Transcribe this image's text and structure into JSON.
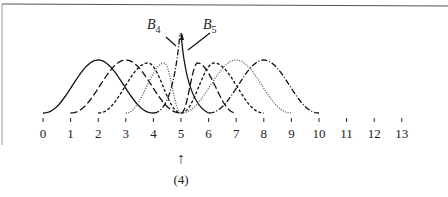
{
  "figure": {
    "title": "",
    "axis": {
      "ticks": [
        "0",
        "1",
        "2",
        "3",
        "4",
        "5",
        "6",
        "7",
        "8",
        "9",
        "10",
        "11",
        "12",
        "13"
      ],
      "x0_px": 43,
      "spacing_px": 27.6,
      "baseline_px": 113
    },
    "annotations": {
      "b4_label": "B",
      "b4_sub": "4",
      "b5_label": "B",
      "b5_sub": "5",
      "arrow": "↑",
      "multiplicity_label": "(4)"
    }
  },
  "chart_data": {
    "type": "line",
    "xlabel": "",
    "ylabel": "",
    "x_ticks": [
      0,
      1,
      2,
      3,
      4,
      5,
      6,
      7,
      8,
      9,
      10,
      11,
      12,
      13
    ],
    "series": [
      {
        "name": "B0",
        "style": "solid",
        "support": [
          0,
          4
        ],
        "peak_x": 2
      },
      {
        "name": "B1",
        "style": "long-dash",
        "support": [
          1,
          5
        ],
        "peak_x": 3
      },
      {
        "name": "B2",
        "style": "dashed",
        "support": [
          2,
          5
        ],
        "peak_x": 3.8
      },
      {
        "name": "B3",
        "style": "dotted",
        "support": [
          3,
          5
        ],
        "peak_x": 4.4
      },
      {
        "name": "B4",
        "style": "dash-dot",
        "support": [
          4,
          5
        ],
        "peak_x": 5,
        "note": "spike at knot 5"
      },
      {
        "name": "B5",
        "style": "solid",
        "support": [
          5,
          6
        ],
        "peak_x": 5,
        "note": "spike at knot 5"
      },
      {
        "name": "B6",
        "style": "long-dash",
        "support": [
          5,
          7
        ],
        "peak_x": 5.6
      },
      {
        "name": "B7",
        "style": "dashed",
        "support": [
          5,
          8
        ],
        "peak_x": 6.2
      },
      {
        "name": "B8",
        "style": "dotted",
        "support": [
          5,
          9
        ],
        "peak_x": 7
      },
      {
        "name": "B9",
        "style": "dash-dot",
        "support": [
          6,
          10
        ],
        "peak_x": 8
      }
    ],
    "annotations": [
      "B4",
      "B5",
      "↑ (4) at x=5"
    ],
    "grid": false
  }
}
